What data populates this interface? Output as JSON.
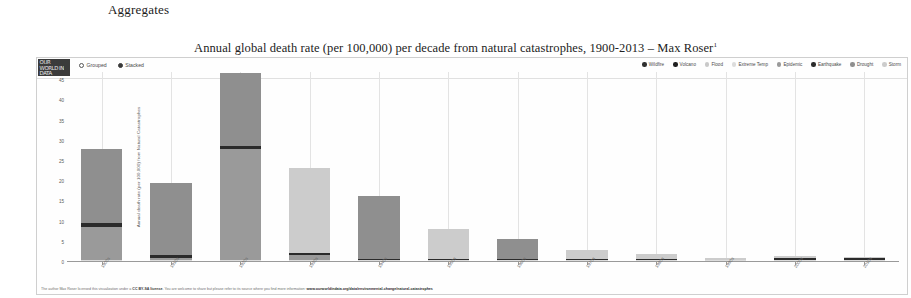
{
  "page": {
    "heading": "Aggregates"
  },
  "chart": {
    "title": "Annual global death rate (per 100,000) per decade from natural catastrophes, 1900-2013 – Max Roser",
    "title_footnote": "1",
    "logo_text": "OUR WORLD IN DATA",
    "mode_controls": [
      {
        "label": "Grouped",
        "selected": false
      },
      {
        "label": "Stacked",
        "selected": true
      }
    ],
    "footer_prefix": "The author Max Roser licensed this visualization under a ",
    "footer_license": "CC BY-SA license",
    "footer_middle": ". You are welcome to share but please refer to its source where you find more information: ",
    "footer_url": "www.ourworldindata.org/data/environmental-change/natural-catastrophes"
  },
  "chart_data": {
    "type": "bar",
    "title": "Annual global death rate (per 100,000) per decade from natural catastrophes, 1900-2013 – Max Roser",
    "subtitle": "",
    "xlabel": "",
    "ylabel": "Annual death rate (per 100,000) from Natural Catastrophes",
    "ylim": [
      0,
      47
    ],
    "yticks": [
      0,
      5,
      10,
      15,
      20,
      25,
      30,
      35,
      40,
      45
    ],
    "peak_tick": 47,
    "grid": "vertical",
    "legend_position": "top-right",
    "stacked": true,
    "categories": [
      "1900s",
      "1910s",
      "1920s",
      "1930s",
      "1940s",
      "1950s",
      "1960s",
      "1970s",
      "1980s",
      "1990s",
      "2000s",
      "2010s"
    ],
    "series": [
      {
        "name": "Wildfire",
        "color": "#2f2f2f",
        "values": [
          0.0,
          0.0,
          0.0,
          0.0,
          0.0,
          0.0,
          0.0,
          0.0,
          0.0,
          0.0,
          0.0,
          0.0
        ]
      },
      {
        "name": "Volcano",
        "color": "#1f1f1f",
        "values": [
          0.02,
          0.02,
          0.02,
          0.02,
          0.02,
          0.02,
          0.02,
          0.02,
          0.02,
          0.02,
          0.02,
          0.02
        ]
      },
      {
        "name": "Flood",
        "color": "#c9c9c9",
        "values": [
          0.1,
          0.1,
          0.1,
          0.1,
          0.1,
          0.1,
          0.1,
          0.1,
          0.1,
          0.1,
          0.08,
          0.08
        ]
      },
      {
        "name": "Extreme Temp",
        "color": "#dcdcdc",
        "values": [
          0.02,
          0.02,
          0.02,
          0.02,
          0.02,
          0.02,
          0.02,
          0.02,
          0.02,
          0.05,
          0.06,
          0.05
        ]
      },
      {
        "name": "Epidemic",
        "color": "#9a9a9a",
        "values": [
          8.3,
          0.6,
          27.5,
          1.2,
          0.0,
          0.0,
          0.0,
          0.0,
          0.0,
          0.0,
          0.0,
          0.0
        ]
      },
      {
        "name": "Earthquake",
        "color": "#2b2b2b",
        "values": [
          0.8,
          0.6,
          0.8,
          0.5,
          0.2,
          0.2,
          0.2,
          0.3,
          0.2,
          0.15,
          0.6,
          0.55
        ]
      },
      {
        "name": "Drought",
        "color": "#8f8f8f",
        "values": [
          18.3,
          17.8,
          18.1,
          0.0,
          15.8,
          0.0,
          5.0,
          0.0,
          0.0,
          0.0,
          0.0,
          0.0
        ]
      },
      {
        "name": "Storm",
        "color": "#cccccc",
        "values": [
          0.0,
          0.0,
          0.0,
          21.0,
          0.0,
          7.6,
          0.0,
          2.2,
          1.4,
          0.3,
          0.4,
          0.3
        ]
      }
    ],
    "totals": [
      27.1,
      19.0,
      47.0,
      22.8,
      16.1,
      7.9,
      5.3,
      2.6,
      1.7,
      0.6,
      1.2,
      1.0
    ]
  }
}
